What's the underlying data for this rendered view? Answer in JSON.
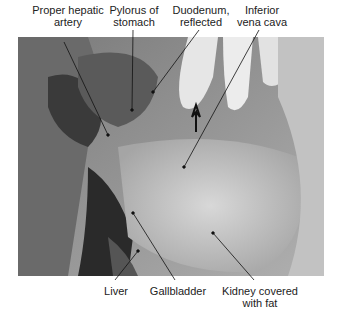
{
  "figure": {
    "top_labels": [
      {
        "line1": "Proper hepatic",
        "line2": "artery"
      },
      {
        "line1": "Pylorus of",
        "line2": "stomach"
      },
      {
        "line1": "Duodenum,",
        "line2": "reflected"
      },
      {
        "line1": "Inferior",
        "line2": "vena cava"
      }
    ],
    "bottom_labels": [
      {
        "line1": "Liver",
        "line2": ""
      },
      {
        "line1": "Gallbladder",
        "line2": ""
      },
      {
        "line1": "Kidney covered",
        "line2": "with fat"
      }
    ]
  }
}
